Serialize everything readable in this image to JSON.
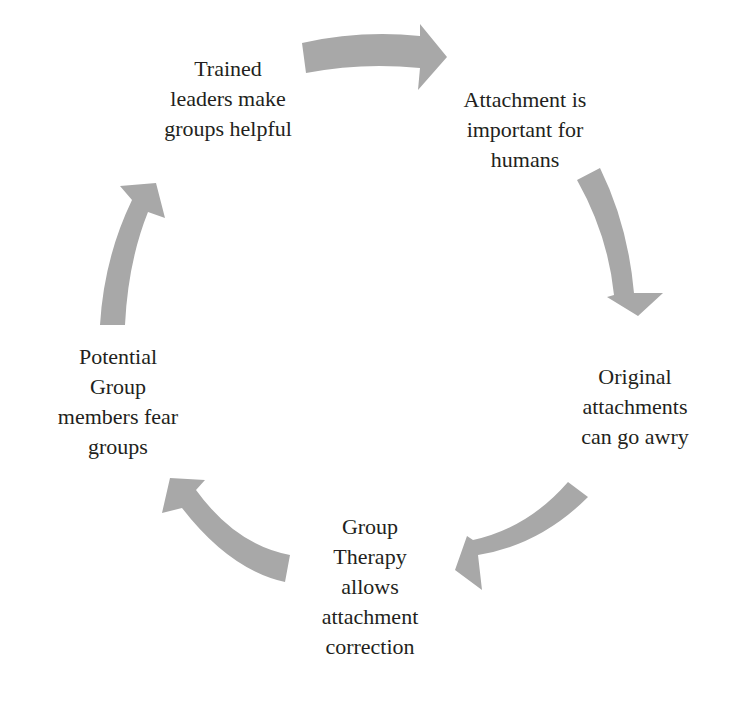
{
  "diagram": {
    "type": "cycle",
    "arrow_color": "#a8a8a8",
    "text_color": "#231f20",
    "nodes": [
      {
        "id": "trained-leaders",
        "lines": [
          "Trained",
          "leaders make",
          "groups helpful"
        ]
      },
      {
        "id": "attachment-important",
        "lines": [
          "Attachment is",
          "important for",
          "humans"
        ]
      },
      {
        "id": "original-attachments",
        "lines": [
          "Original",
          "attachments",
          "can go awry"
        ]
      },
      {
        "id": "group-therapy",
        "lines": [
          "Group",
          "Therapy",
          "allows",
          "attachment",
          "correction"
        ]
      },
      {
        "id": "potential-members",
        "lines": [
          "Potential",
          "Group",
          "members fear",
          "groups"
        ]
      }
    ],
    "edges": [
      {
        "from": "trained-leaders",
        "to": "attachment-important"
      },
      {
        "from": "attachment-important",
        "to": "original-attachments"
      },
      {
        "from": "original-attachments",
        "to": "group-therapy"
      },
      {
        "from": "group-therapy",
        "to": "potential-members"
      },
      {
        "from": "potential-members",
        "to": "trained-leaders"
      }
    ]
  }
}
